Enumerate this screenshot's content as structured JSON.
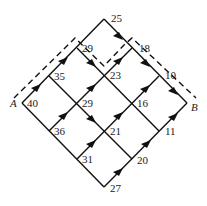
{
  "diagram": {
    "type": "directed grid network (shortest path)",
    "start_label": "A",
    "end_label": "B",
    "nodes": [
      {
        "id": "A",
        "label": "40",
        "x": 22,
        "y": 103
      },
      {
        "id": "n35",
        "label": "35",
        "x": 49,
        "y": 76
      },
      {
        "id": "n29a",
        "label": "29",
        "x": 77,
        "y": 48
      },
      {
        "id": "n25",
        "label": "25",
        "x": 104,
        "y": 19
      },
      {
        "id": "n36",
        "label": "36",
        "x": 49,
        "y": 131
      },
      {
        "id": "n29b",
        "label": "29",
        "x": 77,
        "y": 103
      },
      {
        "id": "n23",
        "label": "23",
        "x": 104,
        "y": 76
      },
      {
        "id": "n18",
        "label": "18",
        "x": 132,
        "y": 48
      },
      {
        "id": "n31",
        "label": "31",
        "x": 77,
        "y": 159
      },
      {
        "id": "n21",
        "label": "21",
        "x": 104,
        "y": 131
      },
      {
        "id": "n16",
        "label": "16",
        "x": 132,
        "y": 103
      },
      {
        "id": "n10",
        "label": "10",
        "x": 159,
        "y": 76
      },
      {
        "id": "n27",
        "label": "27",
        "x": 104,
        "y": 187
      },
      {
        "id": "n20",
        "label": "20",
        "x": 132,
        "y": 159
      },
      {
        "id": "n11",
        "label": "11",
        "x": 159,
        "y": 131
      },
      {
        "id": "B",
        "label": "",
        "x": 187,
        "y": 103
      }
    ],
    "highlighted_path": [
      "A",
      "n35",
      "n29a",
      "n23",
      "n18",
      "n10",
      "B"
    ],
    "colors": {
      "line": "#111111",
      "text": "#222222",
      "background": "#ffffff"
    }
  }
}
